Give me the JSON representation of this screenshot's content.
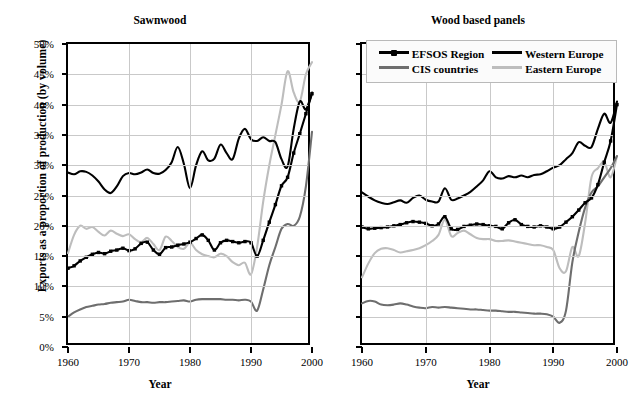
{
  "figure": {
    "ylabel": "Exports as a proportion of production (by volume)",
    "xlabel_left": "Year",
    "xlabel_right": "Year"
  },
  "legend": {
    "position": "top-right-panel",
    "entries": [
      {
        "label": "EFSOS Region",
        "color": "#000000",
        "marker": true
      },
      {
        "label": "Western Europe",
        "color": "#000000",
        "marker": false
      },
      {
        "label": "CIS countries",
        "color": "#6e6e6e",
        "marker": false
      },
      {
        "label": "Eastern Europe",
        "color": "#bdbdbd",
        "marker": false
      }
    ]
  },
  "chart_data": [
    {
      "type": "line",
      "title": "Sawnwood",
      "xlabel": "Year",
      "ylabel": "Exports as a proportion of production (by volume)",
      "xlim": [
        1960,
        2000
      ],
      "ylim": [
        0,
        50
      ],
      "yticks": [
        "0%",
        "5%",
        "10%",
        "15%",
        "20%",
        "25%",
        "30%",
        "35%",
        "40%",
        "45%",
        "50%"
      ],
      "xticks": [
        "1960",
        "1970",
        "1980",
        "1990",
        "2000"
      ],
      "grid": true,
      "x": [
        1960,
        1961,
        1962,
        1963,
        1964,
        1965,
        1966,
        1967,
        1968,
        1969,
        1970,
        1971,
        1972,
        1973,
        1974,
        1975,
        1976,
        1977,
        1978,
        1979,
        1980,
        1981,
        1982,
        1983,
        1984,
        1985,
        1986,
        1987,
        1988,
        1989,
        1990,
        1991,
        1992,
        1993,
        1994,
        1995,
        1996,
        1997,
        1998,
        1999,
        2000
      ],
      "series": [
        {
          "name": "EFSOS Region",
          "color": "#000000",
          "marker": true,
          "values": [
            13.0,
            13.4,
            14.2,
            14.8,
            15.3,
            15.6,
            15.4,
            15.8,
            16.0,
            16.3,
            15.9,
            16.2,
            17.1,
            17.3,
            16.0,
            15.3,
            16.4,
            16.5,
            16.8,
            17.0,
            17.3,
            17.9,
            18.5,
            17.6,
            16.0,
            17.2,
            17.6,
            17.4,
            17.2,
            17.4,
            17.2,
            15.0,
            17.6,
            20.6,
            23.5,
            26.6,
            28.0,
            32.0,
            35.2,
            38.5,
            41.8
          ]
        },
        {
          "name": "Western Europe",
          "color": "#000000",
          "marker": false,
          "values": [
            28.8,
            28.5,
            29.0,
            28.9,
            28.3,
            27.3,
            26.0,
            25.4,
            26.5,
            28.2,
            28.7,
            28.5,
            28.8,
            29.3,
            28.7,
            28.6,
            29.2,
            30.5,
            33.0,
            30.2,
            26.2,
            30.0,
            32.3,
            30.8,
            31.1,
            33.4,
            32.0,
            31.0,
            34.4,
            36.0,
            34.3,
            34.0,
            34.6,
            34.0,
            33.8,
            31.0,
            29.8,
            36.0,
            40.5,
            39.2,
            42.0
          ]
        },
        {
          "name": "CIS countries",
          "color": "#6e6e6e",
          "marker": false,
          "values": [
            5.0,
            5.7,
            6.2,
            6.6,
            6.8,
            7.0,
            7.1,
            7.3,
            7.4,
            7.5,
            7.8,
            7.6,
            7.4,
            7.4,
            7.3,
            7.4,
            7.4,
            7.5,
            7.6,
            7.7,
            7.5,
            7.8,
            7.9,
            7.9,
            7.9,
            7.9,
            7.8,
            7.8,
            7.7,
            7.8,
            7.5,
            6.0,
            9.5,
            13.5,
            16.5,
            19.5,
            20.3,
            20.0,
            21.5,
            26.5,
            35.5
          ]
        },
        {
          "name": "Eastern Europe",
          "color": "#bdbdbd",
          "marker": false,
          "values": [
            15.5,
            18.5,
            20.0,
            19.5,
            19.8,
            19.0,
            18.4,
            19.2,
            18.7,
            18.3,
            18.6,
            17.8,
            17.3,
            18.0,
            17.0,
            16.0,
            18.2,
            17.5,
            16.5,
            16.2,
            17.2,
            16.0,
            15.3,
            15.0,
            14.8,
            15.4,
            15.0,
            14.0,
            13.5,
            13.9,
            12.0,
            16.5,
            24.0,
            30.0,
            35.0,
            40.0,
            45.5,
            42.0,
            40.5,
            45.0,
            47.0
          ]
        }
      ]
    },
    {
      "type": "line",
      "title": "Wood based panels",
      "xlabel": "Year",
      "ylabel": "Exports as a proportion of production (by volume)",
      "xlim": [
        1960,
        2000
      ],
      "ylim": [
        0,
        50
      ],
      "yticks": [
        "0%",
        "5%",
        "10%",
        "15%",
        "20%",
        "25%",
        "30%",
        "35%",
        "40%",
        "45%",
        "50%"
      ],
      "xticks": [
        "1960",
        "1970",
        "1980",
        "1990",
        "2000"
      ],
      "grid": true,
      "x": [
        1960,
        1961,
        1962,
        1963,
        1964,
        1965,
        1966,
        1967,
        1968,
        1969,
        1970,
        1971,
        1972,
        1973,
        1974,
        1975,
        1976,
        1977,
        1978,
        1979,
        1980,
        1981,
        1982,
        1983,
        1984,
        1985,
        1986,
        1987,
        1988,
        1989,
        1990,
        1991,
        1992,
        1993,
        1994,
        1995,
        1996,
        1997,
        1998,
        1999,
        2000
      ],
      "series": [
        {
          "name": "EFSOS Region",
          "color": "#000000",
          "marker": true,
          "values": [
            19.8,
            19.5,
            19.6,
            19.7,
            19.8,
            20.0,
            20.2,
            20.5,
            20.7,
            20.6,
            20.4,
            20.0,
            20.3,
            21.5,
            19.5,
            19.4,
            19.9,
            20.1,
            20.3,
            20.2,
            20.0,
            19.9,
            19.5,
            20.5,
            21.0,
            20.2,
            19.9,
            19.8,
            20.0,
            19.8,
            19.5,
            19.8,
            20.6,
            21.5,
            22.6,
            23.8,
            24.6,
            26.8,
            30.5,
            34.0,
            40.0
          ]
        },
        {
          "name": "Western Europe",
          "color": "#000000",
          "marker": false,
          "values": [
            25.5,
            24.8,
            24.2,
            23.8,
            23.6,
            23.9,
            24.2,
            23.8,
            24.6,
            25.0,
            24.3,
            24.0,
            24.0,
            26.2,
            24.3,
            24.5,
            25.0,
            25.6,
            26.5,
            27.5,
            29.0,
            28.0,
            27.8,
            28.2,
            28.0,
            28.3,
            28.0,
            28.4,
            28.5,
            29.0,
            29.6,
            30.0,
            31.0,
            32.0,
            33.8,
            33.2,
            33.0,
            36.0,
            38.5,
            37.0,
            40.5
          ]
        },
        {
          "name": "CIS countries",
          "color": "#6e6e6e",
          "marker": false,
          "values": [
            7.2,
            7.6,
            7.5,
            7.0,
            6.9,
            7.0,
            7.2,
            7.0,
            6.7,
            6.5,
            6.4,
            6.6,
            6.5,
            6.6,
            6.5,
            6.4,
            6.3,
            6.2,
            6.2,
            6.1,
            6.0,
            6.0,
            5.9,
            5.8,
            5.8,
            5.7,
            5.6,
            5.5,
            5.5,
            5.4,
            5.0,
            4.0,
            6.0,
            14.0,
            19.0,
            23.0,
            25.5,
            26.5,
            28.0,
            29.5,
            31.5
          ]
        },
        {
          "name": "Eastern Europe",
          "color": "#bdbdbd",
          "marker": false,
          "values": [
            11.5,
            13.8,
            15.5,
            16.2,
            16.3,
            16.0,
            15.6,
            15.8,
            16.0,
            16.3,
            16.8,
            17.5,
            18.5,
            21.0,
            18.3,
            18.8,
            19.2,
            18.6,
            18.0,
            17.8,
            17.8,
            17.5,
            17.5,
            17.6,
            17.4,
            17.2,
            17.0,
            16.8,
            16.8,
            16.5,
            16.0,
            13.0,
            12.5,
            16.5,
            15.0,
            20.5,
            28.0,
            29.5,
            30.5,
            28.0,
            31.5
          ]
        }
      ]
    }
  ]
}
